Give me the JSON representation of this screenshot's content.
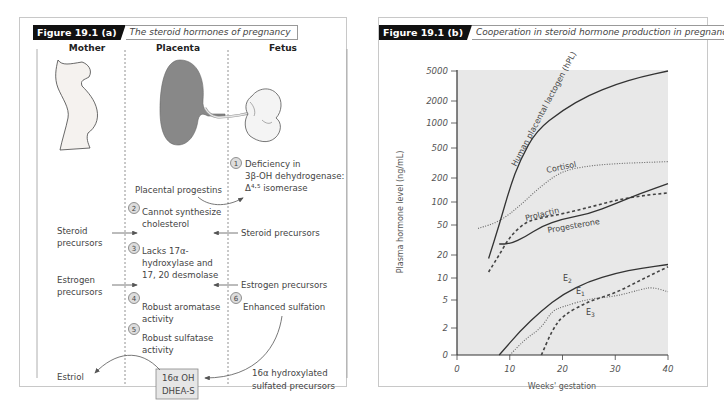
{
  "panel_a": {
    "tag": "Figure 19.1 (a)",
    "title": "The steroid hormones of pregnancy",
    "columns": [
      "Mother",
      "Placenta",
      "Fetus"
    ],
    "steps": [
      {
        "num": "1",
        "text": [
          "Deficiency in",
          "3β-OH dehydrogenase:",
          "Δ⁴·⁵ isomerase"
        ]
      },
      {
        "num": "2",
        "text": [
          "Cannot synthesize",
          "cholesterol"
        ]
      },
      {
        "num": "3",
        "text": [
          "Lacks 17α-",
          "hydroxylase and",
          "17, 20 desmolase"
        ]
      },
      {
        "num": "4",
        "text": [
          "Robust aromatase",
          "activity"
        ]
      },
      {
        "num": "5",
        "text": [
          "Robust sulfatase",
          "activity"
        ]
      },
      {
        "num": "6",
        "text": [
          "Enhanced sulfation"
        ]
      }
    ],
    "labels": {
      "placental_progestins": "Placental progestins",
      "mother_steroid": [
        "Steroid",
        "precursors"
      ],
      "fetus_steroid": "Steroid precursors",
      "mother_estrogen": [
        "Estrogen",
        "precursors"
      ],
      "fetus_estrogen": "Estrogen precursors",
      "estriol": "Estriol",
      "box": [
        "16α OH",
        "DHEA-S"
      ],
      "hydroxylated": [
        "16α hydroxylated",
        "sulfated precursors"
      ]
    }
  },
  "panel_b": {
    "tag": "Figure 19.1 (b)",
    "title": "Cooperation in steroid hormone production in pregnancy"
  },
  "chart_data": {
    "type": "line",
    "title": "Cooperation in steroid hormone production in pregnancy",
    "xlabel": "Weeks' gestation",
    "ylabel": "Plasma hormone level (ng/mL)",
    "xlim": [
      0,
      40
    ],
    "x_ticks": [
      0,
      10,
      20,
      30,
      40
    ],
    "y_scale": "log",
    "y_ticks": [
      0,
      2,
      5,
      10,
      20,
      50,
      100,
      200,
      500,
      1000,
      2000,
      5000
    ],
    "grid": false,
    "legend": "inline labels",
    "series": [
      {
        "name": "Human placental lactogen (hPL)",
        "style": "solid",
        "x": [
          6,
          8,
          10,
          12,
          15,
          20,
          25,
          30,
          35,
          40
        ],
        "y": [
          18,
          50,
          150,
          350,
          800,
          1500,
          2400,
          3300,
          4200,
          5000
        ]
      },
      {
        "name": "Cortisol",
        "style": "dotted",
        "x": [
          4,
          8,
          12,
          16,
          20,
          25,
          30,
          35,
          40
        ],
        "y": [
          45,
          55,
          90,
          160,
          250,
          290,
          310,
          320,
          330
        ]
      },
      {
        "name": "Prolactin",
        "style": "dashed",
        "x": [
          6,
          8,
          10,
          13,
          16,
          20,
          25,
          30,
          35,
          40
        ],
        "y": [
          12,
          20,
          35,
          55,
          62,
          70,
          85,
          105,
          120,
          130
        ]
      },
      {
        "name": "Progesterone",
        "style": "solid",
        "x": [
          8,
          10,
          13,
          16,
          20,
          25,
          30,
          35,
          40
        ],
        "y": [
          28,
          28,
          35,
          48,
          60,
          70,
          95,
          130,
          170
        ]
      },
      {
        "name": "E2",
        "style": "solid",
        "x": [
          8,
          12,
          16,
          20,
          25,
          30,
          35,
          40
        ],
        "y": [
          0,
          1.8,
          3.5,
          6,
          9,
          11.5,
          13.5,
          15
        ]
      },
      {
        "name": "E1",
        "style": "dotted",
        "x": [
          10,
          13,
          16,
          18,
          20,
          25,
          30,
          35,
          37,
          40
        ],
        "y": [
          0,
          1.2,
          2,
          3.5,
          4,
          5.2,
          5.6,
          7,
          7.5,
          6.5
        ]
      },
      {
        "name": "E3",
        "style": "dashed",
        "x": [
          16,
          18,
          20,
          25,
          30,
          35,
          40
        ],
        "y": [
          0,
          1.8,
          3,
          4.8,
          6.2,
          9.5,
          14
        ]
      }
    ]
  }
}
